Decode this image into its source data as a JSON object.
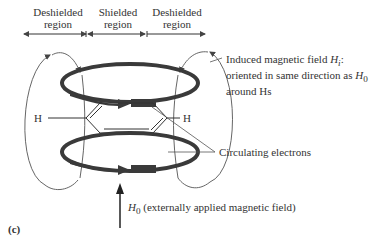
{
  "regions": {
    "left": {
      "line1": "Deshielded",
      "line2": "region"
    },
    "middle": {
      "line1": "Shielded",
      "line2": "region"
    },
    "right": {
      "line1": "Deshielded",
      "line2": "region"
    }
  },
  "labels": {
    "induced_line1_prefix": "Induced magnetic field ",
    "induced_symbol": "H",
    "induced_sub": "i",
    "induced_line1_suffix": ":",
    "induced_line2_prefix": "oriented in same direction as ",
    "h0_symbol": "H",
    "h0_sub": "0",
    "induced_line3": "around Hs",
    "circulating": "Circulating electrons",
    "applied_suffix": " (externally applied magnetic field)",
    "hydrogen_left": "H",
    "hydrogen_right": "H",
    "panel": "(c)"
  },
  "colors": {
    "ring": "#3a3a3a",
    "field_lines": "#555555",
    "text": "#333333"
  }
}
